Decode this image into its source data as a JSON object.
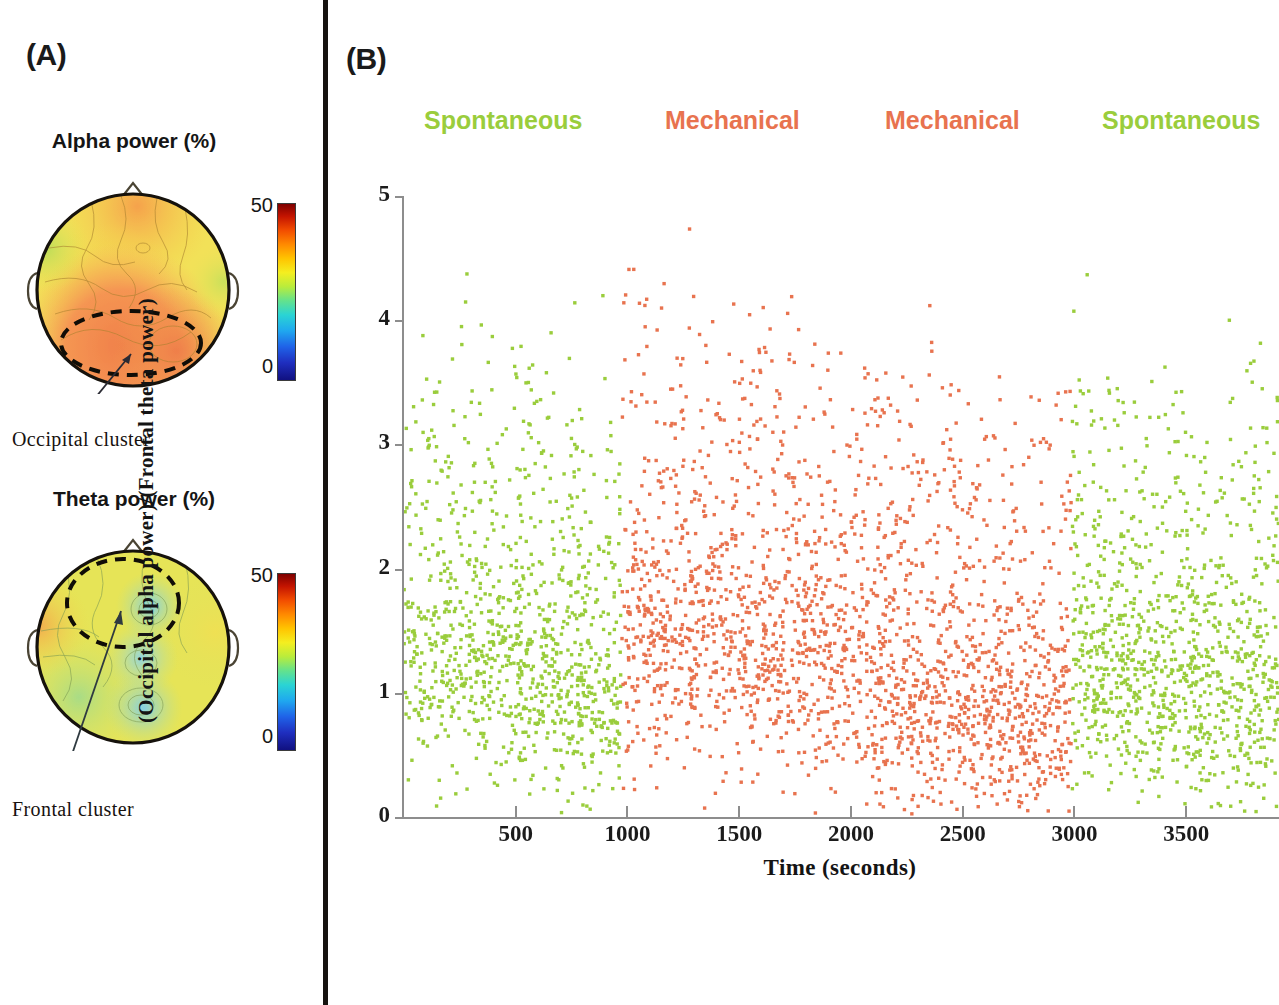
{
  "panels": {
    "a": {
      "letter": "(A)"
    },
    "b": {
      "letter": "(B)"
    }
  },
  "topomaps": [
    {
      "id": "alpha",
      "title": "Alpha power (%)",
      "colorbar": {
        "max": "50",
        "min": "0"
      },
      "cluster_label": "Occipital  cluster",
      "cluster_region": "occipital"
    },
    {
      "id": "theta",
      "title": "Theta power (%)",
      "colorbar": {
        "max": "50",
        "min": "0"
      },
      "cluster_label": "Frontal  cluster",
      "cluster_region": "frontal"
    }
  ],
  "colors": {
    "spontaneous": "#9ACD3C",
    "mechanical": "#E8734F",
    "axis": "#8d8d8d",
    "text": "#161616",
    "divider": "#161310"
  },
  "conditions": [
    {
      "label": "Spontaneous",
      "color": "#9ACD3C"
    },
    {
      "label": "Mechanical",
      "color": "#E8734F"
    },
    {
      "label": "Mechanical",
      "color": "#E8734F"
    },
    {
      "label": "Spontaneous",
      "color": "#9ACD3C"
    }
  ],
  "chart_data": {
    "type": "scatter",
    "title": "",
    "xlabel": "Time (seconds)",
    "ylabel": "(Occipital alpha power)/(Frontal theta power)",
    "xlim": [
      0,
      3915
    ],
    "ylim": [
      0,
      5
    ],
    "xticks": [
      500,
      1000,
      1500,
      2000,
      2500,
      3000,
      3500
    ],
    "xticklabels": [
      "500",
      "1000",
      "1500",
      "2000",
      "2500",
      "3000",
      "3500"
    ],
    "yticks": [
      0,
      1,
      2,
      3,
      4,
      5
    ],
    "yticklabels": [
      "0",
      "1",
      "2",
      "3",
      "4",
      "5"
    ],
    "grid": false,
    "legend": "above-plot",
    "series": [
      {
        "name": "Spontaneous",
        "color": "#9ACD3C",
        "x_range": [
          0,
          970
        ],
        "n_points": 1050,
        "y_median": 1.55,
        "y_spread": 0.95,
        "seed": 11
      },
      {
        "name": "Mechanical",
        "color": "#E8734F",
        "x_range": [
          975,
          2080
        ],
        "n_points": 1180,
        "y_median": 1.75,
        "y_spread": 1.05,
        "seed": 27
      },
      {
        "name": "Mechanical",
        "color": "#E8734F",
        "x_range": [
          2085,
          2985
        ],
        "n_points": 1020,
        "y_median": 1.25,
        "y_spread": 0.85,
        "seed": 43
      },
      {
        "name": "Spontaneous",
        "color": "#9ACD3C",
        "x_range": [
          2990,
          3915
        ],
        "n_points": 1060,
        "y_median": 1.45,
        "y_spread": 0.9,
        "seed": 59
      }
    ],
    "marker": {
      "shape": "square",
      "size_px": 3.4
    }
  }
}
